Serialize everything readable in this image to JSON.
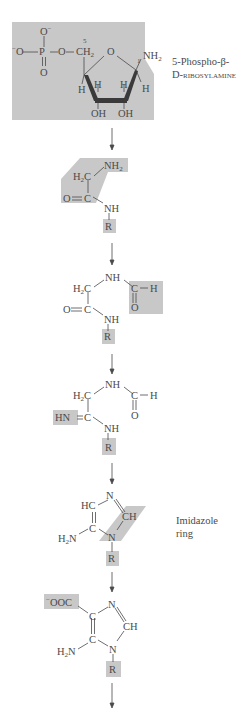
{
  "figure": {
    "shading_color": "#c8c8c8",
    "ink_color": "#4a4a4a"
  },
  "compounds": [
    {
      "id": "prpp-amine",
      "name_line1": "5-Phospho-β-",
      "name_line2": "D-ribosylamine",
      "atoms": {
        "o_top": "O",
        "o_top_charge": "−",
        "o_left": "O",
        "o_left_charge": "−",
        "p": "P",
        "o_bridge": "O",
        "o_bottom": "O",
        "ch2": "CH",
        "ch2_sub": "2",
        "c5_num": "5",
        "ring_o": "O",
        "c1_num": "1",
        "nh2": "NH",
        "nh2_sub": "2",
        "h_left": "H",
        "h_c4": "H",
        "h_c3": "H",
        "h_c1": "H",
        "oh_left": "OH",
        "oh_right": "OH"
      }
    },
    {
      "id": "glycinamide-ribonucleotide",
      "atoms": {
        "nh2": "NH",
        "nh2_sub": "2",
        "h2c": "H",
        "h2c_sub": "2",
        "h2c_c": "C",
        "o": "O",
        "c": "C",
        "nh": "NH",
        "r": "R"
      }
    },
    {
      "id": "formylglycinamide-ribonucleotide",
      "atoms": {
        "nh_top": "NH",
        "h2c": "H",
        "h2c_sub": "2",
        "h2c_c": "C",
        "c_formyl": "C",
        "h_formyl": "H",
        "o_formyl": "O",
        "o": "O",
        "c": "C",
        "nh": "NH",
        "r": "R"
      }
    },
    {
      "id": "formylglycinamidine-ribonucleotide",
      "atoms": {
        "nh_top": "NH",
        "h2c": "H",
        "h2c_sub": "2",
        "h2c_c": "C",
        "c_formyl": "C",
        "h_formyl": "H",
        "o_formyl": "O",
        "hn": "HN",
        "c": "C",
        "nh": "NH",
        "r": "R"
      }
    },
    {
      "id": "aminoimidazole-ribonucleotide",
      "name_line1": "Imidazole",
      "name_line2": "ring",
      "atoms": {
        "hc": "HC",
        "n_top": "N",
        "ch": "CH",
        "c": "C",
        "n": "N",
        "h2n": "H",
        "h2n_sub": "2",
        "h2n_n": "N",
        "r": "R"
      }
    },
    {
      "id": "carboxyaminoimidazole-ribonucleotide",
      "atoms": {
        "ooc_charge": "−",
        "ooc": "OOC",
        "c_top": "C",
        "n_top": "N",
        "ch": "CH",
        "c": "C",
        "n": "N",
        "h2n": "H",
        "h2n_sub": "2",
        "h2n_n": "N",
        "r": "R"
      }
    }
  ],
  "arrows": [
    {
      "from": "prpp-amine",
      "to": "glycinamide-ribonucleotide"
    },
    {
      "from": "glycinamide-ribonucleotide",
      "to": "formylglycinamide-ribonucleotide"
    },
    {
      "from": "formylglycinamide-ribonucleotide",
      "to": "formylglycinamidine-ribonucleotide"
    },
    {
      "from": "formylglycinamidine-ribonucleotide",
      "to": "aminoimidazole-ribonucleotide"
    },
    {
      "from": "aminoimidazole-ribonucleotide",
      "to": "carboxyaminoimidazole-ribonucleotide"
    },
    {
      "from": "carboxyaminoimidazole-ribonucleotide",
      "to": "next"
    }
  ]
}
